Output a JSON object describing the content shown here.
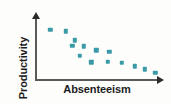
{
  "chart_data": {
    "type": "scatter",
    "title": "",
    "xlabel": "Absenteeism",
    "ylabel": "Productivity",
    "grid": false,
    "legend": null,
    "xlim": [
      0,
      100
    ],
    "ylim": [
      0,
      100
    ],
    "axis_ticks": {
      "x": [],
      "y": []
    },
    "axes_style": "arrowed-L-frame",
    "point_color": "#3b9aa8",
    "axis_color": "#5a5a5a",
    "series": [
      {
        "name": "observations",
        "points": [
          {
            "x": 12,
            "y": 76
          },
          {
            "x": 24,
            "y": 74
          },
          {
            "x": 31,
            "y": 60
          },
          {
            "x": 29,
            "y": 52
          },
          {
            "x": 38,
            "y": 51
          },
          {
            "x": 48,
            "y": 45
          },
          {
            "x": 35,
            "y": 37
          },
          {
            "x": 58,
            "y": 43
          },
          {
            "x": 44,
            "y": 27
          },
          {
            "x": 57,
            "y": 28
          },
          {
            "x": 68,
            "y": 26
          },
          {
            "x": 78,
            "y": 21
          },
          {
            "x": 86,
            "y": 16
          },
          {
            "x": 94,
            "y": 11
          }
        ]
      }
    ],
    "relationship": "negative correlation"
  },
  "figure": {
    "width": 171,
    "height": 103,
    "background": "#fdfdfc"
  }
}
